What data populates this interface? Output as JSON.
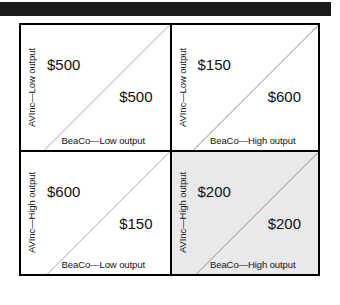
{
  "figure": {
    "type": "payoff-matrix",
    "row_player": "AVInc",
    "column_player": "BeaCo",
    "top_rule_color": "#1a1a1a",
    "highlight_color": "#e9e9e9",
    "border_color": "#000000",
    "diagonal_color": "#a9a9a9"
  },
  "cells": [
    {
      "id": "low-low",
      "row_label": "AVInc—Low output",
      "col_label": "BeaCo—Low output",
      "row_payoff": "$500",
      "col_payoff": "$500",
      "shaded": false
    },
    {
      "id": "low-high",
      "row_label": "AVInc—Low output",
      "col_label": "BeaCo—High output",
      "row_payoff": "$150",
      "col_payoff": "$600",
      "shaded": false
    },
    {
      "id": "high-low",
      "row_label": "AVInc—High output",
      "col_label": "BeaCo—Low output",
      "row_payoff": "$600",
      "col_payoff": "$150",
      "shaded": false
    },
    {
      "id": "high-high",
      "row_label": "AVInc—High output",
      "col_label": "BeaCo—High output",
      "row_payoff": "$200",
      "col_payoff": "$200",
      "shaded": true
    }
  ]
}
